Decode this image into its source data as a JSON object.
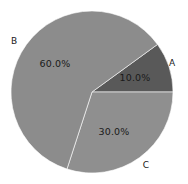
{
  "figure": {
    "width": 188,
    "height": 184,
    "background": "#ffffff",
    "title_remnant": "",
    "label_color": "#1a1a1a"
  },
  "chart_data": {
    "type": "pie",
    "title": "",
    "categories": [
      "A",
      "B",
      "C"
    ],
    "values": [
      10.0,
      30.0,
      60.0
    ],
    "labels": [
      "A",
      "B",
      "C"
    ],
    "autopct_labels": [
      "10.0%",
      "30.0%",
      "60.0%"
    ],
    "colors": [
      "#595959",
      "#8c8c8c",
      "#8f8f8f"
    ],
    "startangle": 0,
    "counterclock": true,
    "legend": "none",
    "grid": false,
    "slices": [
      {
        "name": "A",
        "label": "A",
        "value": 10.0,
        "percent": "10.0%",
        "color": "#595959",
        "start_angle": 0,
        "end_angle": 36,
        "label_x": 172,
        "label_y": 63,
        "pct_x": 135,
        "pct_y": 78
      },
      {
        "name": "C",
        "label": "C",
        "value": 30.0,
        "percent": "30.0%",
        "color": "#8f8f8f",
        "start_angle": 252,
        "end_angle": 360,
        "label_x": 146,
        "label_y": 165,
        "pct_x": 114,
        "pct_y": 132
      },
      {
        "name": "B",
        "label": "B",
        "value": 60.0,
        "percent": "60.0%",
        "color": "#8c8c8c",
        "start_angle": 36,
        "end_angle": 252,
        "label_x": 14,
        "label_y": 41,
        "pct_x": 55,
        "pct_y": 64
      }
    ],
    "geometry": {
      "center_x": 92,
      "center_y": 92,
      "radius": 81
    }
  }
}
